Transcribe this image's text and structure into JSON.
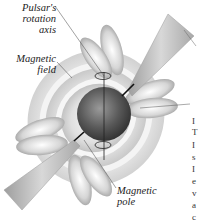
{
  "figure": {
    "labels": {
      "rotation_axis": [
        "Pulsar's",
        "rotation",
        "axis"
      ],
      "magnetic_field": [
        "Magnetic",
        "field"
      ],
      "magnetic_pole": [
        "Magnetic",
        "pole"
      ]
    },
    "colors": {
      "sphere_dark": "#3a3a3a",
      "sphere_light": "#9a9a9a",
      "beam": "#b8b8b8",
      "field_light": "#f2f2f2",
      "field_dark": "#8a8a8a",
      "text": "#222222"
    },
    "cropped_text_fragments": [
      "I",
      "T",
      "I",
      "s",
      "I",
      "e",
      "v",
      "a",
      "c"
    ]
  }
}
